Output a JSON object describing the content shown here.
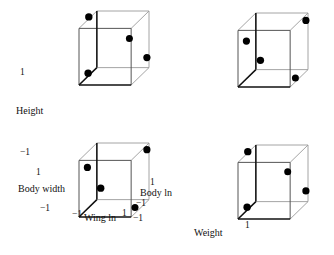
{
  "figure": {
    "title": "",
    "background": "#ffffff",
    "point_color": "#000000",
    "edge_color": "#9a9a9a",
    "bold_edge_color": "#111111"
  },
  "axis_labels": {
    "height": "Height",
    "body_width": "Body width",
    "wing_ln": "Wing ln",
    "body_ln": "Body ln",
    "weight": "Weight"
  },
  "ticks": {
    "pos": "1",
    "neg": "−1"
  },
  "tick_marks": [
    {
      "id": "tl-pos-1",
      "value": "1",
      "x": 20,
      "y": 68
    },
    {
      "id": "bl-neg-1",
      "value": "−1",
      "x": 20,
      "y": 148
    },
    {
      "id": "bl-pos-1",
      "value": "1",
      "x": 36,
      "y": 168
    },
    {
      "id": "bl-neg-2",
      "value": "−1",
      "x": 40,
      "y": 204
    },
    {
      "id": "wing-neg",
      "value": "−1",
      "x": 72,
      "y": 210
    },
    {
      "id": "wing-pos",
      "value": "1",
      "x": 122,
      "y": 209
    },
    {
      "id": "bodyln-pos",
      "value": "1",
      "x": 150,
      "y": 178
    },
    {
      "id": "bodyln-neg",
      "value": "−1",
      "x": 136,
      "y": 199
    },
    {
      "id": "corner-neg",
      "value": "−1",
      "x": 133,
      "y": 214
    },
    {
      "id": "weight-pos",
      "value": "1",
      "x": 245,
      "y": 221
    }
  ],
  "text_labels": [
    {
      "id": "label-height",
      "key": "height",
      "text": "Height",
      "x": 16,
      "y": 106
    },
    {
      "id": "label-body-width",
      "key": "body_width",
      "text": "Body width",
      "x": 18,
      "y": 184
    },
    {
      "id": "label-wing-ln",
      "key": "wing_ln",
      "text": "Wing ln",
      "x": 84,
      "y": 213
    },
    {
      "id": "label-body-ln",
      "key": "body_ln",
      "text": "Body ln",
      "x": 140,
      "y": 188
    },
    {
      "id": "label-weight",
      "key": "weight",
      "text": "Weight",
      "x": 194,
      "y": 228
    }
  ],
  "panels": [
    {
      "id": "panel-top-left",
      "name": "cube-plot-height-vs-wing-ln",
      "x": 79,
      "y": 11,
      "w": 70,
      "h": 74,
      "points": [
        {
          "x": 0.14,
          "y": 0.08,
          "r": 3.7
        },
        {
          "x": 0.72,
          "y": 0.37,
          "r": 3.5
        },
        {
          "x": 0.97,
          "y": 0.63,
          "r": 3.6
        },
        {
          "x": 0.13,
          "y": 0.84,
          "r": 3.7
        }
      ]
    },
    {
      "id": "panel-top-right",
      "name": "cube-plot-height-vs-body-ln",
      "x": 238,
      "y": 13,
      "w": 70,
      "h": 74,
      "points": [
        {
          "x": 0.97,
          "y": 0.1,
          "r": 3.6
        },
        {
          "x": 0.12,
          "y": 0.38,
          "r": 3.6
        },
        {
          "x": 0.32,
          "y": 0.64,
          "r": 3.7
        },
        {
          "x": 0.82,
          "y": 0.88,
          "r": 3.5
        }
      ]
    },
    {
      "id": "panel-bottom-left",
      "name": "cube-plot-body-width-vs-wing-ln",
      "x": 79,
      "y": 143,
      "w": 70,
      "h": 74,
      "points": [
        {
          "x": 0.97,
          "y": 0.09,
          "r": 3.6
        },
        {
          "x": 0.12,
          "y": 0.33,
          "r": 3.6
        },
        {
          "x": 0.31,
          "y": 0.61,
          "r": 3.7
        },
        {
          "x": 0.8,
          "y": 0.87,
          "r": 3.5
        }
      ]
    },
    {
      "id": "panel-bottom-right",
      "name": "cube-plot-weight-vs-body-ln",
      "x": 238,
      "y": 145,
      "w": 70,
      "h": 74,
      "points": [
        {
          "x": 0.14,
          "y": 0.09,
          "r": 3.7
        },
        {
          "x": 0.71,
          "y": 0.36,
          "r": 3.5
        },
        {
          "x": 0.97,
          "y": 0.62,
          "r": 3.6
        },
        {
          "x": 0.13,
          "y": 0.84,
          "r": 3.7
        }
      ]
    }
  ],
  "chart_data": {
    "type": "scatter",
    "title": "",
    "xlabel": "Wing ln",
    "ylabel": "Body width",
    "zlabel": "Height",
    "axis_names": [
      "Height",
      "Body width",
      "Wing ln",
      "Body ln",
      "Weight"
    ],
    "axis_range": [
      -1,
      1
    ],
    "tick_labels": [
      "-1",
      "1"
    ],
    "grid": false,
    "legend": false,
    "panels": [
      {
        "name": "cube-plot-height-vs-wing-ln",
        "xlabel": "Wing ln",
        "ylabel": "Height",
        "n_points": 4,
        "points": [
          [
            -0.72,
            0.84
          ],
          [
            0.44,
            0.26
          ],
          [
            0.94,
            -0.26
          ],
          [
            -0.74,
            -0.68
          ]
        ]
      },
      {
        "name": "cube-plot-height-vs-body-ln",
        "xlabel": "Body ln",
        "ylabel": "Height",
        "n_points": 4,
        "points": [
          [
            0.94,
            0.8
          ],
          [
            -0.76,
            0.24
          ],
          [
            -0.36,
            -0.28
          ],
          [
            0.64,
            -0.76
          ]
        ]
      },
      {
        "name": "cube-plot-body-width-vs-wing-ln",
        "xlabel": "Wing ln",
        "ylabel": "Body width",
        "n_points": 4,
        "points": [
          [
            0.94,
            0.82
          ],
          [
            -0.76,
            0.34
          ],
          [
            -0.38,
            -0.22
          ],
          [
            0.6,
            -0.74
          ]
        ]
      },
      {
        "name": "cube-plot-weight-vs-body-ln",
        "xlabel": "Body ln",
        "ylabel": "Weight",
        "n_points": 4,
        "points": [
          [
            -0.72,
            0.82
          ],
          [
            0.42,
            0.28
          ],
          [
            0.94,
            -0.24
          ],
          [
            -0.74,
            -0.68
          ]
        ]
      }
    ]
  }
}
